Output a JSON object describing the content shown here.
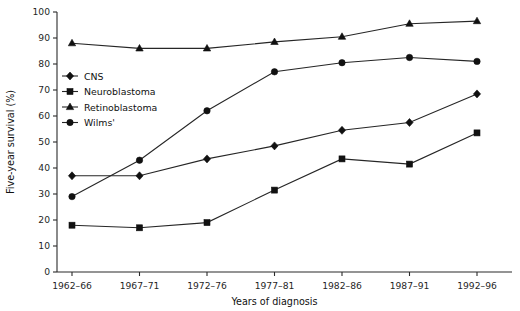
{
  "chart_data": {
    "type": "line",
    "title": "",
    "xlabel": "Years of diagnosis",
    "ylabel": "Five-year survival (%)",
    "categories": [
      "1962–66",
      "1967–71",
      "1972–76",
      "1977–81",
      "1982–86",
      "1987–91",
      "1992–96"
    ],
    "ylim": [
      0,
      100
    ],
    "yticks": [
      0,
      10,
      20,
      30,
      40,
      50,
      60,
      70,
      80,
      90,
      100
    ],
    "grid": false,
    "legend_position": "upper-left-inside",
    "series": [
      {
        "name": "CNS",
        "marker": "diamond",
        "values": [
          37,
          37,
          43.5,
          48.5,
          54.5,
          57.5,
          68.5
        ]
      },
      {
        "name": "Neuroblastoma",
        "marker": "square",
        "values": [
          18,
          17,
          19,
          31.5,
          43.5,
          41.5,
          53.5
        ]
      },
      {
        "name": "Retinoblastoma",
        "marker": "triangle",
        "values": [
          88,
          86,
          86,
          88.5,
          90.5,
          95.5,
          96.5
        ]
      },
      {
        "name": "Wilms'",
        "marker": "circle",
        "values": [
          29,
          43,
          62,
          77,
          80.5,
          82.5,
          81
        ]
      }
    ]
  },
  "legend": {
    "items": [
      {
        "label": "CNS"
      },
      {
        "label": "Neuroblastoma"
      },
      {
        "label": "Retinoblastoma"
      },
      {
        "label": "Wilms'"
      }
    ]
  },
  "axes": {
    "y_tick_labels": [
      "0",
      "10",
      "20",
      "30",
      "40",
      "50",
      "60",
      "70",
      "80",
      "90",
      "100"
    ],
    "x_tick_labels": [
      "1962–66",
      "1967–71",
      "1972–76",
      "1977–81",
      "1982–86",
      "1987–91",
      "1992–96"
    ],
    "y_axis_title": "Five-year survival (%)",
    "x_axis_title": "Years of diagnosis"
  }
}
